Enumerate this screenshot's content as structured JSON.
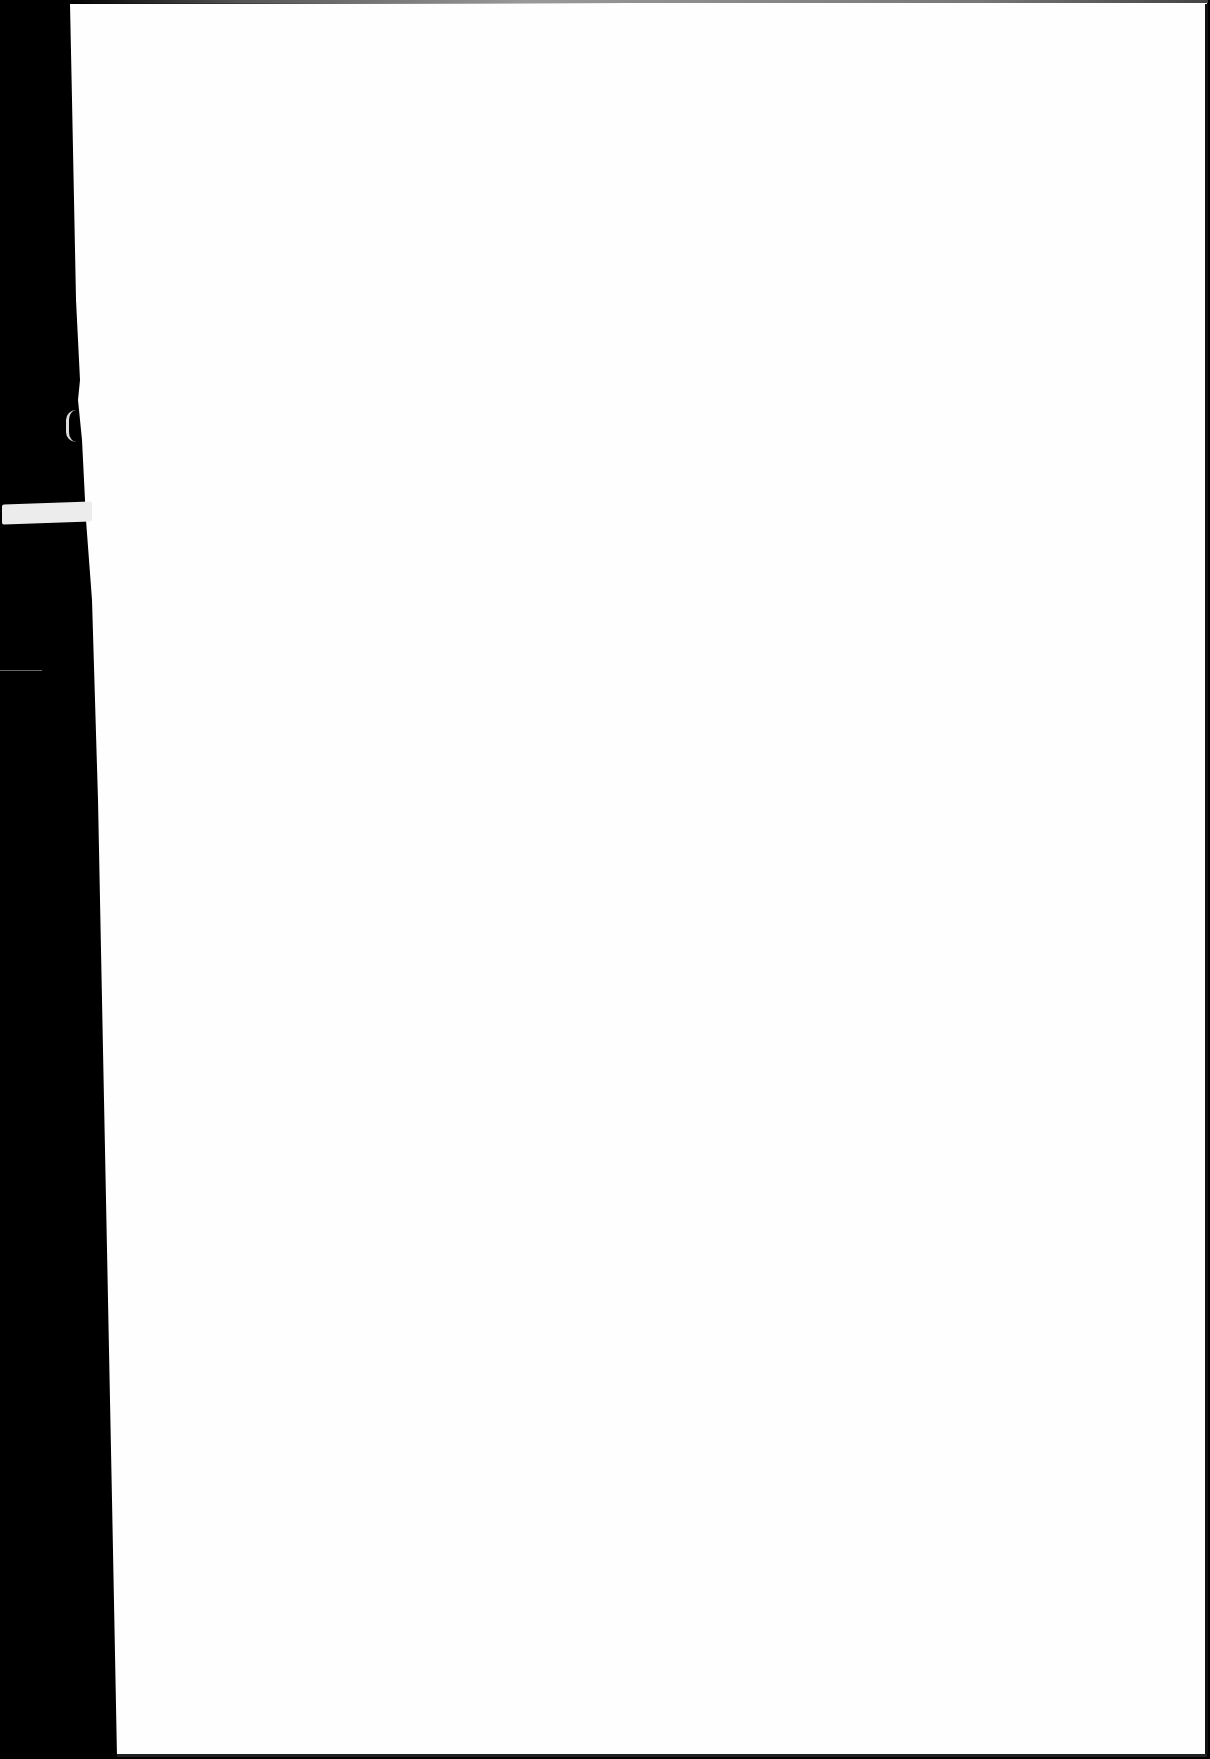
{
  "document": {
    "type": "scanned-page",
    "content": "",
    "colors": {
      "page": "#fefefe",
      "background": "#000000",
      "tape": "#ececec"
    }
  }
}
